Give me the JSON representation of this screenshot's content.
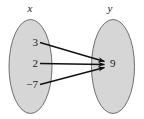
{
  "figure": {
    "kind": "mapping-diagram",
    "domain_set": {
      "name": "x",
      "elements": [
        "3",
        "2",
        "−7"
      ]
    },
    "range_set": {
      "name": "y",
      "elements": [
        "9"
      ]
    },
    "mappings": [
      {
        "from": "3",
        "to": "9"
      },
      {
        "from": "2",
        "to": "9"
      },
      {
        "from": "−7",
        "to": "9"
      }
    ],
    "colors": {
      "ellipse_fill": "#d6d6d6",
      "ellipse_stroke": "#6e6e6e",
      "arrow": "#111111",
      "text": "#1a1a1a",
      "background": "#ffffff"
    }
  }
}
